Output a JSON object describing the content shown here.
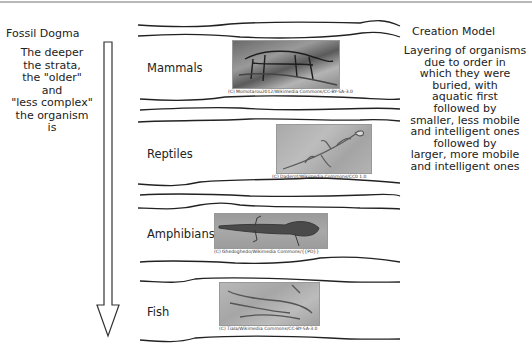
{
  "left_column": {
    "title": "Fossil Dogma",
    "description": "The deeper\nthe strata,\nthe \"older\"\nand\n\"less complex\"\nthe organism\nis"
  },
  "right_column": {
    "title": "Creation Model",
    "description": "Layering of organisms\ndue to order in\nwhich they were\nburied, with\naquatic first\nfollowed by\nsmaller, less mobile\nand intelligent ones\nfollowed by\nlarger, more mobile\nand intelligent ones"
  },
  "arrow": {
    "direction": "down",
    "icon": "down-arrow-icon"
  },
  "layers": [
    {
      "label": "Mammals",
      "caption": "(C) Momotarou2012/Wikimedia Commons/CC-BY-SA-3.0",
      "image": "mammal-skeleton-fossil"
    },
    {
      "label": "Reptiles",
      "caption": "(C) Daderot/Wikimedia Commons/CC0 1.0",
      "image": "reptile-fossil"
    },
    {
      "label": "Amphibians",
      "caption": "(C) Ghedoghedo/Wikimedia Commons/{{PD}}",
      "image": "amphibian-fossil"
    },
    {
      "label": "Fish",
      "caption": "(C) Tiala/Wikimedia Commons/CC-BY-SA-3.0",
      "image": "fish-fossil"
    }
  ],
  "colors": {
    "line": "#222222",
    "text": "#222222",
    "top_border": "#b8b8b8"
  }
}
